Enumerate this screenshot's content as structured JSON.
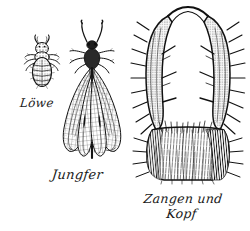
{
  "plate": {
    "title": "Ameisenlöwe Tafel",
    "background_color": "#ffffff",
    "ink_color": "#111111",
    "medium": "engraving"
  },
  "figures": [
    {
      "id": "larva",
      "caption": "Löwe",
      "subject": "antlion larva, dorsal view",
      "position": "left"
    },
    {
      "id": "adult",
      "caption": "Jungfer",
      "subject": "adult antlion with net-veined wings",
      "position": "center"
    },
    {
      "id": "mandibles",
      "caption_line1": "Zangen und",
      "caption_line2": "Kopf",
      "subject": "mandibles and head, enlarged",
      "position": "right"
    }
  ],
  "icons": {
    "larva": "antlion-larva-icon",
    "adult": "antlion-adult-icon",
    "mandibles": "antlion-mandibles-icon"
  }
}
